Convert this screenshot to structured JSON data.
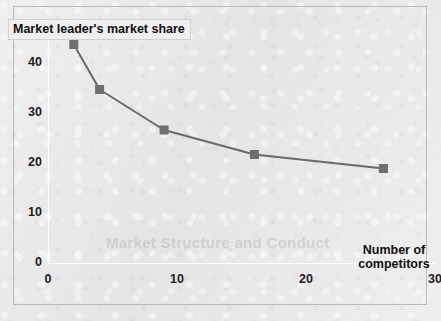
{
  "figure": {
    "background_color": "#e9e9e9",
    "frame_border_color": "#b9b9b9",
    "ghost_watermark": "Market Structure and Conduct"
  },
  "chart_data": {
    "type": "line",
    "title": "",
    "ylabel": "Market leader's market share",
    "xlabel": "Number of competitors",
    "xlabel_lines": [
      "Number of",
      "competitors"
    ],
    "x": [
      2,
      4,
      9,
      16,
      26
    ],
    "values": [
      43.5,
      34.5,
      26.4,
      21.5,
      18.7
    ],
    "series": [
      {
        "name": "Market leader's market share",
        "x": [
          2,
          4,
          9,
          16,
          26
        ],
        "values": [
          43.5,
          34.5,
          26.4,
          21.5,
          18.7
        ]
      }
    ],
    "xlim": [
      0,
      30
    ],
    "ylim": [
      0,
      48
    ],
    "xticks": [
      0,
      10,
      20,
      30
    ],
    "yticks": [
      0,
      10,
      20,
      30,
      40
    ],
    "xtick_labels": [
      "0",
      "10",
      "20",
      "30"
    ],
    "ytick_labels": [
      "0",
      "10",
      "20",
      "30",
      "40"
    ],
    "grid": false,
    "legend": null,
    "line_color": "#6a6a6a",
    "marker_color": "#6e6e6e",
    "marker_shape": "square",
    "axis_color": "#ffffff"
  }
}
